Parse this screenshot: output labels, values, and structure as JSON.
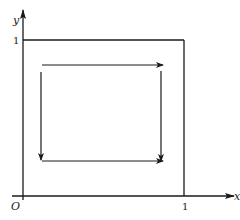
{
  "diagram": {
    "axes": {
      "x_label": "x",
      "y_label": "y",
      "origin_label": "O",
      "x_tick_label": "1",
      "y_tick_label": "1"
    },
    "square": {
      "from": [
        0,
        0
      ],
      "to": [
        1,
        1
      ]
    },
    "arrows": [
      {
        "name": "top",
        "direction": "right"
      },
      {
        "name": "right",
        "direction": "down"
      },
      {
        "name": "bottom",
        "direction": "right"
      },
      {
        "name": "left",
        "direction": "down"
      }
    ],
    "colors": {
      "stroke": "#1a1a1a",
      "background": "#ffffff"
    }
  }
}
